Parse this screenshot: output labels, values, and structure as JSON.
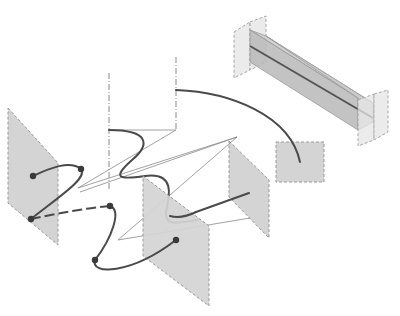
{
  "figure": {
    "colors": {
      "plane_fill": "#d4d4d4",
      "plane_stroke": "#9a9a9a",
      "curve": "#4a4a4a",
      "thin_line": "#8a8a8a",
      "dot": "#3a3a3a",
      "background": "#ffffff"
    },
    "elements": {
      "planes": [
        {
          "id": "left-plane",
          "points": "8,108 58,163 58,245 8,203"
        },
        {
          "id": "center-plane",
          "points": "143,176 209,226 209,306 143,256"
        },
        {
          "id": "right-plane",
          "points": "229,141 269,180 269,238 229,197"
        },
        {
          "id": "square-plate",
          "points": "276,142 324,142 324,182 276,182"
        }
      ],
      "dots": [
        {
          "id": "p1",
          "x": 33,
          "y": 176
        },
        {
          "id": "p2",
          "x": 81,
          "y": 169
        },
        {
          "id": "p3",
          "x": 31,
          "y": 219
        },
        {
          "id": "p4",
          "x": 110,
          "y": 206
        },
        {
          "id": "p5",
          "x": 95,
          "y": 260
        },
        {
          "id": "p6",
          "x": 176,
          "y": 240
        }
      ],
      "labels": []
    }
  }
}
